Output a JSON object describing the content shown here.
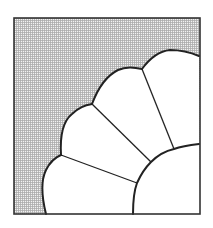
{
  "diagram": {
    "type": "quilt-block",
    "pattern": "fan",
    "blade_count": 4,
    "colors": {
      "background": "#ffffff",
      "outline": "#222222",
      "blade_fill": "#ffffff",
      "shading_base": "#f2f2f2",
      "shading_grid": "#a8a8a8"
    },
    "block": {
      "x": 14,
      "y": 18,
      "width": 186,
      "height": 196
    },
    "shaded_region": "background-corner",
    "blades": [
      {
        "id": 1,
        "label": ""
      },
      {
        "id": 2,
        "label": ""
      },
      {
        "id": 3,
        "label": ""
      },
      {
        "id": 4,
        "label": ""
      }
    ],
    "center": {
      "shape": "quarter-circle",
      "label": ""
    }
  }
}
